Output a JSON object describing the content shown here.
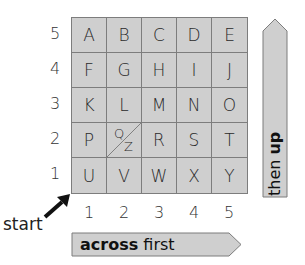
{
  "grid": {
    "rows": [
      {
        "label": "5",
        "cells": [
          "A",
          "B",
          "C",
          "D",
          "E"
        ]
      },
      {
        "label": "4",
        "cells": [
          "F",
          "G",
          "H",
          "I",
          "J"
        ]
      },
      {
        "label": "3",
        "cells": [
          "K",
          "L",
          "M",
          "N",
          "O"
        ]
      },
      {
        "label": "2",
        "cells": [
          "P",
          "Q/Z",
          "R",
          "S",
          "T"
        ]
      },
      {
        "label": "1",
        "cells": [
          "U",
          "V",
          "W",
          "X",
          "Y"
        ]
      }
    ],
    "split_cell": {
      "top": "Q",
      "bottom": "Z"
    },
    "columns": [
      "1",
      "2",
      "3",
      "4",
      "5"
    ],
    "cell_color": "#cfcfcf",
    "line_color": "#7d7d7d"
  },
  "start": {
    "label": "start"
  },
  "across_arrow": {
    "bold": "across",
    "rest": " first"
  },
  "up_arrow": {
    "rest": "then ",
    "bold": "up"
  }
}
